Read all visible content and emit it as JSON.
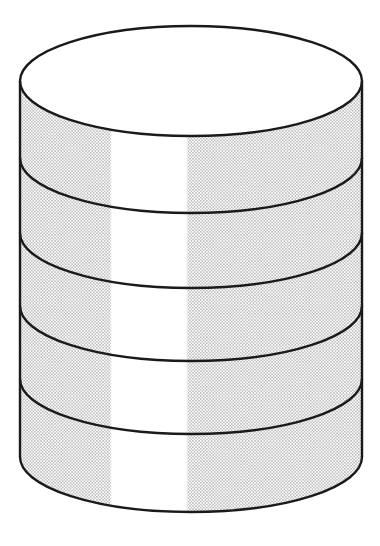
{
  "figure": {
    "name": "stacked-cylinder-diagram",
    "title": "Stacked cylinder (disc stack) line drawing",
    "caption": "",
    "background_color": "#ffffff",
    "stroke_color": "#1a1a1a",
    "fill_color": "#ffffff",
    "stipple_color": "#6e6e6e",
    "highlight_color": "#ffffff"
  },
  "canvas": {
    "width": 380,
    "height": 546
  },
  "geometry": {
    "center_x": 191,
    "left_x": 20,
    "right_x": 362,
    "radius_x": 171,
    "radius_y": 55,
    "top_ellipse_center_y": 81,
    "bottom_ellipse_center_y": 457,
    "disc_count": 5,
    "disc_arc_center_y": [
      81,
      158,
      233,
      306,
      379
    ],
    "stroke_width": 2.4,
    "highlight_band": {
      "x_start": 112,
      "x_end": 186
    }
  },
  "layers": [
    {
      "id": "disc-1",
      "label": "Disc 1 (top)",
      "arc_center_y": 81,
      "band_bottom_y": 158
    },
    {
      "id": "disc-2",
      "label": "Disc 2",
      "arc_center_y": 158,
      "band_bottom_y": 233
    },
    {
      "id": "disc-3",
      "label": "Disc 3",
      "arc_center_y": 233,
      "band_bottom_y": 306
    },
    {
      "id": "disc-4",
      "label": "Disc 4",
      "arc_center_y": 306,
      "band_bottom_y": 379
    },
    {
      "id": "disc-5",
      "label": "Disc 5 (bottom)",
      "arc_center_y": 379,
      "band_bottom_y": 457
    }
  ],
  "shading": {
    "pattern": "halftone-dot-stipple",
    "dot_radius": 0.62,
    "dot_spacing": 3.1,
    "description": "fine dotted stipple on left and right of the cylinder body with a vertical white highlight band through the middle"
  }
}
